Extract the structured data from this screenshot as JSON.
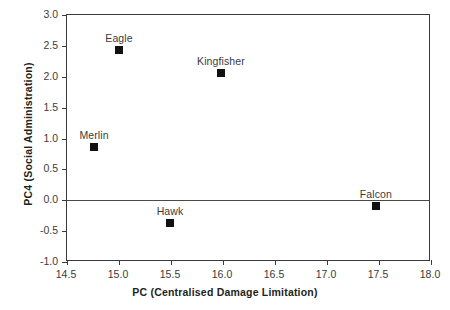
{
  "chart_data": {
    "type": "scatter",
    "title": "",
    "xlabel": "PC (Centralised Damage Limitation)",
    "ylabel": "PC4 (Social Administration)",
    "xlim": [
      14.5,
      18.0
    ],
    "ylim": [
      -1.0,
      3.0
    ],
    "xticks": [
      "14.5",
      "15.0",
      "15.5",
      "16.0",
      "16.5",
      "17.0",
      "17.5",
      "18.0"
    ],
    "xtick_values": [
      14.5,
      15.0,
      15.5,
      16.0,
      16.5,
      17.0,
      17.5,
      18.0
    ],
    "yticks": [
      "3.0",
      "2.5",
      "2.0",
      "1.5",
      "1.0",
      "0.5",
      "0.0",
      "-0.5",
      "-1.0"
    ],
    "ytick_values": [
      3.0,
      2.5,
      2.0,
      1.5,
      1.0,
      0.5,
      0.0,
      -0.5,
      -1.0
    ],
    "grid": false,
    "legend": false,
    "reference_lines": [
      {
        "axis": "y",
        "value": 0.0
      }
    ],
    "marker_color": "#111111",
    "frame_color": "#3a3a3a",
    "points": [
      {
        "label": "Eagle",
        "x": 15.0,
        "y": 2.43
      },
      {
        "label": "Kingfisher",
        "x": 15.98,
        "y": 2.06
      },
      {
        "label": "Merlin",
        "x": 14.76,
        "y": 0.86
      },
      {
        "label": "Hawk",
        "x": 15.49,
        "y": -0.37
      },
      {
        "label": "Falcon",
        "x": 17.47,
        "y": -0.1
      }
    ]
  }
}
